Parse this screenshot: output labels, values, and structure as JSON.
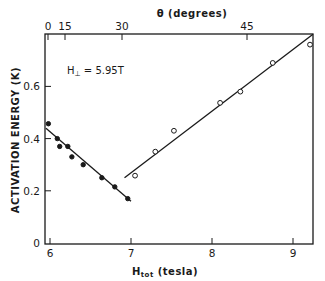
{
  "chart_data": {
    "type": "scatter",
    "title": "",
    "xlabel": "H_tot (tesla)",
    "xlabel_main": "H",
    "xlabel_sub": "tot",
    "xlabel_unit": "(tesla)",
    "ylabel": "ACTIVATION ENERGY (K)",
    "x2label": "θ (degrees)",
    "xlim": [
      5.95,
      9.25
    ],
    "ylim": [
      0,
      0.78
    ],
    "x_ticks": [
      6,
      7,
      8,
      9
    ],
    "x_tick_labels": [
      "6",
      "7",
      "8",
      "9"
    ],
    "y_ticks": [
      0,
      0.2,
      0.4,
      0.6
    ],
    "y_tick_labels": [
      "0",
      "0.2",
      "0.4",
      "0.6"
    ],
    "x2_ticks_at_H": [
      5.95,
      6.19,
      6.89,
      8.43
    ],
    "x2_tick_labels": [
      "0",
      "15",
      "30",
      "45"
    ],
    "annotation": "H⊥ = 5.95T",
    "annotation_main": "H",
    "annotation_sub": "⊥",
    "annotation_rest": " = 5.95T",
    "grid": false,
    "legend": null,
    "series": [
      {
        "name": "filled",
        "marker": "filled-circle",
        "x": [
          5.98,
          6.09,
          6.12,
          6.22,
          6.27,
          6.41,
          6.64,
          6.8,
          6.96
        ],
        "y": [
          0.457,
          0.4,
          0.37,
          0.37,
          0.33,
          0.3,
          0.25,
          0.215,
          0.17
        ],
        "fit_line": {
          "x": [
            5.95,
            7.0
          ],
          "y": [
            0.44,
            0.16
          ]
        }
      },
      {
        "name": "open",
        "marker": "open-circle",
        "x": [
          7.05,
          7.3,
          7.53,
          8.1,
          8.35,
          8.75,
          9.21
        ],
        "y": [
          0.258,
          0.35,
          0.43,
          0.537,
          0.58,
          0.69,
          0.76
        ],
        "fit_line": {
          "x": [
            6.92,
            9.25
          ],
          "y": [
            0.25,
            0.8
          ]
        }
      }
    ]
  }
}
